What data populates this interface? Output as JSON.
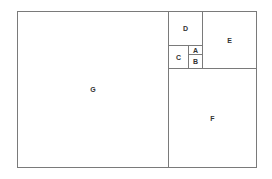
{
  "diagram": {
    "type": "golden-rectangle-subdivision",
    "line_color": "#7a7a7a",
    "label_color": "#333333",
    "regions": [
      {
        "id": "G",
        "label": "G",
        "x": 17,
        "y": 11,
        "w": 152,
        "h": 157
      },
      {
        "id": "F",
        "label": "F",
        "x": 168,
        "y": 68,
        "w": 89,
        "h": 100
      },
      {
        "id": "E",
        "label": "E",
        "x": 202,
        "y": 11,
        "w": 55,
        "h": 58
      },
      {
        "id": "D",
        "label": "D",
        "x": 168,
        "y": 11,
        "w": 35,
        "h": 35
      },
      {
        "id": "C",
        "label": "C",
        "x": 168,
        "y": 45,
        "w": 21,
        "h": 24
      },
      {
        "id": "A",
        "label": "A",
        "x": 188,
        "y": 45,
        "w": 15,
        "h": 10
      },
      {
        "id": "B",
        "label": "B",
        "x": 188,
        "y": 54,
        "w": 15,
        "h": 15
      }
    ]
  }
}
